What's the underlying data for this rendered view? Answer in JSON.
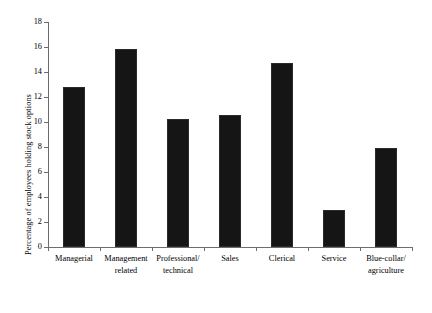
{
  "chart_data": {
    "type": "bar",
    "title": "",
    "subtitle": "",
    "xlabel": "",
    "ylabel": "Percentage of employees holding stock options",
    "categories": [
      "Managerial",
      "Management\nrelated",
      "Professional/\ntechnical",
      "Sales",
      "Clerical",
      "Service",
      "Blue-collar/\nagriculture"
    ],
    "values": [
      12.8,
      15.85,
      10.25,
      10.55,
      14.7,
      3.0,
      7.95
    ],
    "ylim": [
      0,
      18
    ],
    "yticks": [
      0,
      2,
      4,
      6,
      8,
      10,
      12,
      14,
      16,
      18
    ],
    "ytick_labels": [
      "0",
      "2",
      "4",
      "6",
      "8",
      "10",
      "12",
      "14",
      "16",
      "18"
    ],
    "grid": false,
    "legend": null,
    "bar_color": "#151515",
    "axis_color": "#6d6d6d",
    "background": "#ffffff"
  }
}
